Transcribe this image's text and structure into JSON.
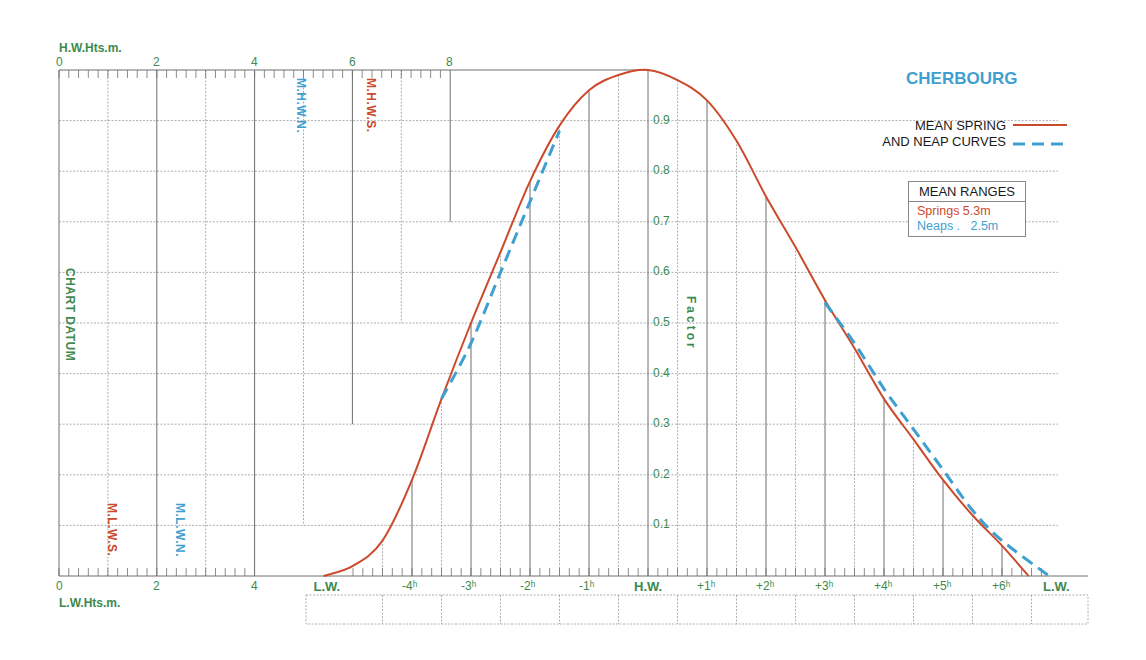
{
  "title": "CHERBOURG",
  "legend": {
    "line1": "MEAN SPRING",
    "line2": "AND NEAP CURVES",
    "spring_color": "#cc4a2c",
    "neap_color": "#3f9fd0"
  },
  "mean_ranges": {
    "header": "MEAN RANGES",
    "springs": "Springs  5.3m",
    "neaps": "Neaps .   2.5m"
  },
  "axes": {
    "hw_heights_label": "H.W.Hts.m.",
    "lw_heights_label": "L.W.Hts.m.",
    "chart_datum_label": "CHART DATUM",
    "factor_label": "Factor",
    "hw_ticks": [
      "0",
      "2",
      "4",
      "6",
      "8"
    ],
    "lw_ticks": [
      "0",
      "2",
      "4"
    ],
    "factor_ticks": [
      "0.9",
      "0.8",
      "0.7",
      "0.6",
      "0.5",
      "0.4",
      "0.3",
      "0.2",
      "0.1"
    ],
    "time_ticks": [
      "L.W.",
      "-4ʰ",
      "-3ʰ",
      "-2ʰ",
      "-1ʰ",
      "H.W.",
      "+1ʰ",
      "+2ʰ",
      "+3ʰ",
      "+4ʰ",
      "+5ʰ",
      "+6ʰ",
      "L.W."
    ]
  },
  "markers": {
    "mhwn": "M.H.W.N.",
    "mhws": "M.H.W.S.",
    "mlws": "M.L.W.S.",
    "mlwn": "M.L.W.N."
  },
  "chart_data": {
    "type": "line",
    "title": "CHERBOURG",
    "xlabel": "Time relative to High Water (hours)",
    "ylabel": "Factor",
    "ylim": [
      0,
      1
    ],
    "grid": true,
    "legend_position": "top-right",
    "x": [
      -5.5,
      -5,
      -4.5,
      -4,
      -3.5,
      -3,
      -2.5,
      -2,
      -1.5,
      -1,
      -0.5,
      0,
      0.5,
      1,
      1.5,
      2,
      2.5,
      3,
      3.5,
      4,
      4.5,
      5,
      5.5,
      6,
      6.45
    ],
    "series": [
      {
        "name": "Mean Spring",
        "style": "solid",
        "values": [
          0.0,
          0.02,
          0.07,
          0.19,
          0.35,
          0.5,
          0.64,
          0.78,
          0.89,
          0.96,
          0.99,
          1.0,
          0.98,
          0.94,
          0.86,
          0.75,
          0.65,
          0.545,
          0.45,
          0.35,
          0.27,
          0.19,
          0.12,
          0.06,
          0.0
        ]
      },
      {
        "name": "Mean Neap",
        "style": "dashed",
        "x": [
          -3.5,
          -3,
          -2.5,
          -2,
          -1.5,
          3,
          3.5,
          4,
          4.5,
          5,
          5.5,
          6,
          6.8
        ],
        "values": [
          0.35,
          0.46,
          0.6,
          0.74,
          0.88,
          0.54,
          0.46,
          0.37,
          0.29,
          0.21,
          0.13,
          0.07,
          0.0
        ]
      }
    ],
    "height_scales": {
      "hw_heights_m": [
        0,
        8
      ],
      "lw_heights_m": [
        0,
        4
      ],
      "MHWS": 6.3,
      "MHWN": 5.0,
      "MLWS": 1.1,
      "MLWN": 2.5
    },
    "mean_ranges": {
      "springs_m": 5.3,
      "neaps_m": 2.5
    }
  }
}
